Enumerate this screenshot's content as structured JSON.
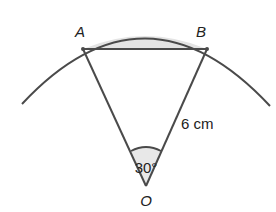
{
  "diagram": {
    "type": "circle-sector-segment",
    "points": {
      "A": {
        "label": "A",
        "x": 83,
        "y": 49
      },
      "B": {
        "label": "B",
        "x": 207,
        "y": 49
      },
      "O": {
        "label": "O",
        "x": 146,
        "y": 186
      }
    },
    "angle_label": "30°",
    "radius_label": "6 cm",
    "colors": {
      "stroke": "#4a4a4a",
      "segment_fill": "#e4e4e4",
      "angle_fill": "#e8e8e8",
      "text": "#222222"
    }
  }
}
